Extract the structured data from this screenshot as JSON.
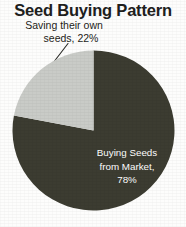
{
  "chart_data": {
    "type": "pie",
    "title": "Seed Buying Pattern",
    "xlabel": "",
    "ylabel": "",
    "categories": [
      "Saving their own seeds",
      "Buying Seeds from Market"
    ],
    "values": [
      22,
      78
    ],
    "unit": "%",
    "legend": "none",
    "grid": false,
    "start_angle_deg": 90,
    "direction": "counterclockwise",
    "slices": [
      {
        "name": "Saving their own seeds",
        "value": 22,
        "color": "#c9cbc7",
        "label_line_1": "Saving their own",
        "label_line_2": "seeds, 22%",
        "label_placement": "outside-callout",
        "has_leader_line": true
      },
      {
        "name": "Buying Seeds from Market",
        "value": 78,
        "color": "#3c3c31",
        "label_line_1": "Buying Seeds",
        "label_line_2": "from Market,",
        "label_line_3": "78%",
        "label_placement": "inside",
        "has_leader_line": false
      }
    ]
  },
  "title": "Seed Buying Pattern",
  "callout": {
    "line1": "Saving their own",
    "line2": "seeds, 22%"
  },
  "inner_label": {
    "line1": "Buying Seeds",
    "line2": "from Market,",
    "line3": "78%"
  },
  "colors": {
    "light_slice": "#c9cbc7",
    "dark_slice": "#3c3c31",
    "background": "#fdfdfc",
    "title_text": "#20201c",
    "callout_text": "#1d1d1a",
    "inner_label_text": "#ffffff",
    "leader_line": "#2a2a26"
  }
}
